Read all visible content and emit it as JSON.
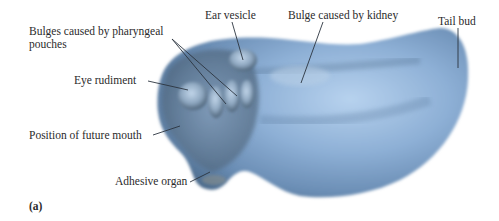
{
  "figure": {
    "panel_label": "(a)",
    "colors": {
      "body_light": "#a9c6e6",
      "body_mid": "#7ea2c8",
      "body_dark": "#4f6b8a",
      "leader_line": "#2b3440",
      "text": "#2b2b2b"
    },
    "labels": [
      {
        "id": "pharyngeal",
        "text_line1": "Bulges caused by pharyngeal",
        "text_line2": "pouches"
      },
      {
        "id": "ear",
        "text": "Ear vesicle"
      },
      {
        "id": "kidney",
        "text": "Bulge caused by kidney"
      },
      {
        "id": "tail",
        "text": "Tail bud"
      },
      {
        "id": "eye",
        "text": "Eye rudiment"
      },
      {
        "id": "mouth",
        "text": "Position of future mouth"
      },
      {
        "id": "adhesive",
        "text": "Adhesive organ"
      }
    ]
  }
}
